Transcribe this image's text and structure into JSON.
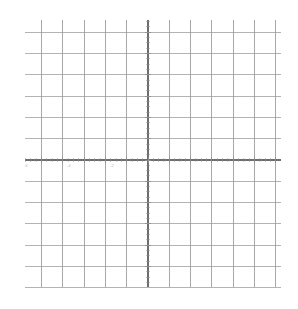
{
  "figure": {
    "kind": "cartesian-coordinate-grid",
    "background_color": "#ffffff",
    "width": 298,
    "height": 309,
    "title": "",
    "subtitle": ""
  },
  "style": {
    "grid_major_color": "#9a9a9a",
    "grid_minor_color": "#cfcfcf",
    "axis_color": "#6d6d6d",
    "tick_color": "#8f8f8f",
    "label_color": "#b9b9b9",
    "grid_major_width": "1",
    "axis_width": "1.2"
  },
  "geometry": {
    "origin_x_px": 148,
    "origin_y_px": 160,
    "cell_px": 21.3,
    "plot_left_px": 25,
    "plot_right_px": 281,
    "plot_top_px": 20,
    "plot_bottom_px": 287,
    "minor_ticks_per_cell": 4
  },
  "chart_data": {
    "type": "line",
    "title": "",
    "xlabel": "",
    "ylabel": "",
    "grid": true,
    "legend": false,
    "series": [],
    "x": [],
    "values": [],
    "xlim": [
      -6,
      6
    ],
    "ylim": [
      -6,
      6
    ],
    "xticks": [
      -6,
      -5,
      -4,
      -3,
      -2,
      -1,
      0,
      1,
      2,
      3,
      4,
      5,
      6
    ],
    "yticks": [
      -6,
      -5,
      -4,
      -3,
      -2,
      -1,
      0,
      1,
      2,
      3,
      4,
      5,
      6
    ],
    "xticklabels": [
      "-6",
      "",
      "-4",
      "",
      "-2",
      "",
      "",
      "",
      "",
      "",
      "",
      "",
      ""
    ],
    "yticklabels": [
      "",
      "",
      "",
      "",
      "",
      "",
      "",
      "",
      "",
      "",
      "",
      "",
      ""
    ],
    "annotations": []
  },
  "axes": {
    "x_axis_name": "x-axis",
    "y_axis_name": "y-axis",
    "visible_x_labels": [
      {
        "value": "-6",
        "x_px": 26,
        "y_px": 167
      },
      {
        "value": "-4",
        "x_px": 69,
        "y_px": 167
      },
      {
        "value": "-2",
        "x_px": 112,
        "y_px": 167
      }
    ],
    "visible_y_labels": []
  }
}
